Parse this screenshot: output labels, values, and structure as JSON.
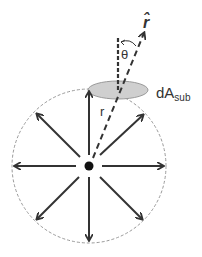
{
  "diagram": {
    "labels": {
      "r_hat": "r̂",
      "theta": "θ",
      "dA": "dA",
      "dA_sub": "sub",
      "r": "r"
    },
    "elements": {
      "center_charge": {
        "cx": 89,
        "cy": 166,
        "r": 4
      },
      "gaussian_surface": {
        "cx": 89,
        "cy": 166,
        "r": 77,
        "style": "dashed"
      },
      "area_element": {
        "cx": 118,
        "cy": 90,
        "rx": 30,
        "ry": 9
      },
      "field_arrows_count": 8
    },
    "colors": {
      "stroke": "#333333",
      "ellipse_fill": "#cfcfcf",
      "ellipse_stroke": "#999999",
      "circle_stroke": "#999999"
    }
  }
}
